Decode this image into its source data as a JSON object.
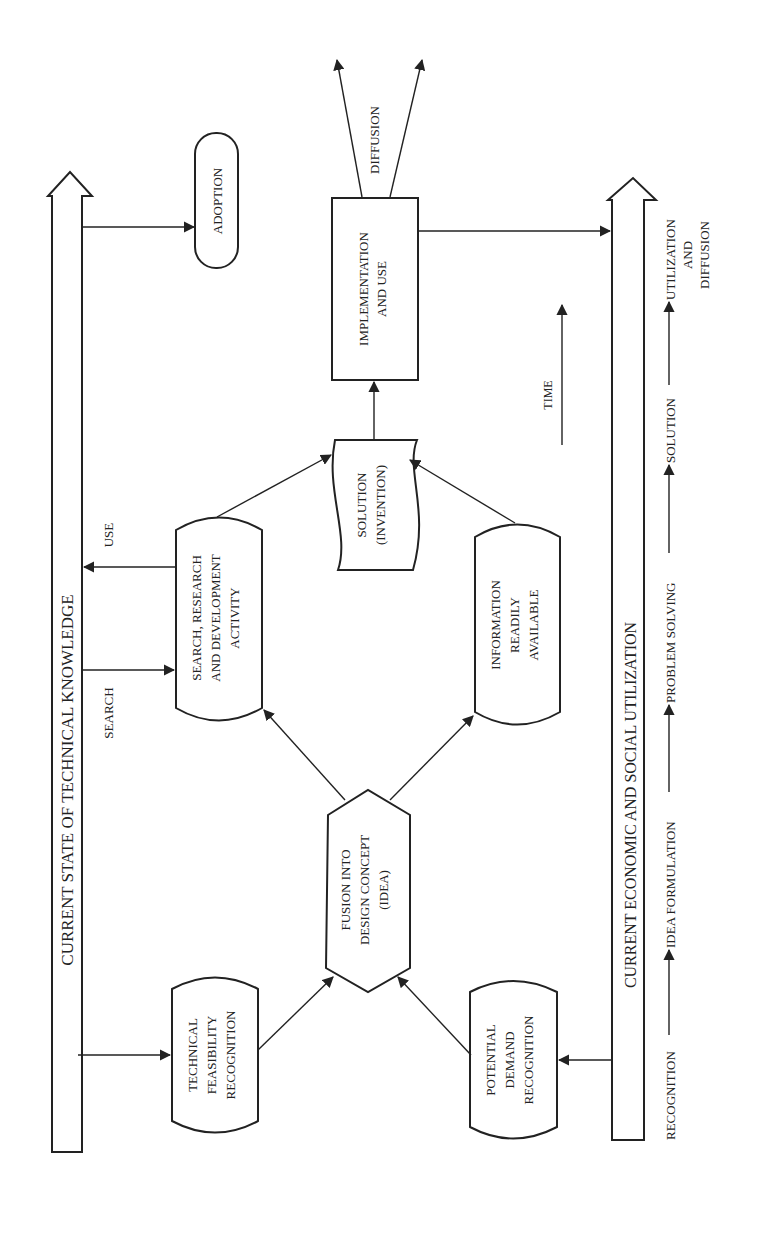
{
  "diagram": {
    "orientation": "rotated-90-ccw",
    "bands": {
      "technical_knowledge": "CURRENT STATE OF TECHNICAL KNOWLEDGE",
      "economic_social": "CURRENT ECONOMIC AND SOCIAL UTILIZATION"
    },
    "nodes": {
      "adoption": "ADOPTION",
      "implementation": [
        "IMPLEMENTATION",
        "AND USE"
      ],
      "solution": [
        "SOLUTION",
        "(INVENTION)"
      ],
      "search_rd": [
        "SEARCH, RESEARCH",
        "AND DEVELOPMENT",
        "ACTIVITY"
      ],
      "information": [
        "INFORMATION",
        "READILY",
        "AVAILABLE"
      ],
      "fusion": [
        "FUSION INTO",
        "DESIGN CONCEPT",
        "(IDEA)"
      ],
      "technical_feasibility": [
        "TECHNICAL",
        "FEASIBILITY",
        "RECOGNITION"
      ],
      "potential_demand": [
        "POTENTIAL",
        "DEMAND",
        "RECOGNITION"
      ]
    },
    "edge_labels": {
      "search": "SEARCH",
      "use": "USE",
      "diffusion": "DIFFUSION",
      "time": "TIME"
    },
    "stages": [
      "RECOGNITION",
      "IDEA FORMULATION",
      "PROBLEM SOLVING",
      "SOLUTION"
    ],
    "final_stage": [
      "UTILIZATION",
      "AND",
      "DIFFUSION"
    ]
  }
}
